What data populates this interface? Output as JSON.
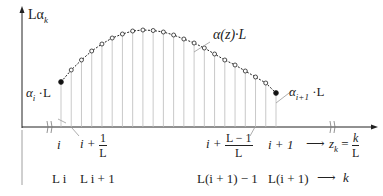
{
  "diagram": {
    "y_axis_label": {
      "main": "Lα",
      "sub": "k"
    },
    "curve_label": "α(z)·L",
    "left_point_label": {
      "main": "α",
      "sub": "i",
      "suffix": " ·L"
    },
    "right_point_label": {
      "main": "α",
      "sub": "i+1",
      "suffix": " ·L"
    },
    "z_axis_ticks": [
      {
        "text": "i"
      },
      {
        "prefix": "i +",
        "num": "1",
        "den": "L"
      },
      {
        "prefix": "i +",
        "num": "L − 1",
        "den": "L"
      },
      {
        "text": "i + 1"
      }
    ],
    "z_axis_label": {
      "lhs_main": "z",
      "lhs_sub": "k",
      "eq": "=",
      "num": "k",
      "den": "L"
    },
    "k_axis_ticks": [
      "L i",
      "L i + 1",
      "L(i + 1) − 1",
      "L(i + 1)"
    ],
    "k_axis_label": "k",
    "arrow_glyph": "⟶",
    "colors": {
      "ink": "#222222",
      "grid": "#bbbbbb"
    }
  },
  "chart_data": {
    "type": "line",
    "title": "",
    "xlabel": "z_k = k/L",
    "ylabel": "Lα_k",
    "x": [
      0,
      1,
      2,
      3,
      4,
      5,
      6,
      7,
      8,
      9,
      10,
      11,
      12,
      13,
      14,
      15,
      16,
      17,
      18,
      19,
      20,
      21
    ],
    "series": [
      {
        "name": "α(z)·L (sampled)",
        "values": [
          45,
          57,
          67,
          76,
          83,
          89,
          93,
          96,
          97,
          96.5,
          95,
          92,
          88,
          84,
          79,
          73,
          67,
          62,
          56,
          50,
          44,
          34
        ]
      }
    ],
    "endpoints": {
      "filled": [
        0,
        21
      ],
      "open": "1..20"
    },
    "grid": false
  }
}
